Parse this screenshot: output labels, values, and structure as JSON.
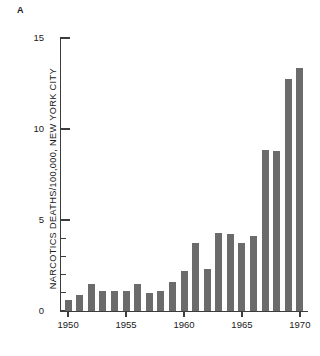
{
  "figure": {
    "panel_label": "A",
    "background_color": "#ffffff",
    "bar_color": "#6b6b6b",
    "axis_color": "#3c3c3c"
  },
  "chart_data": {
    "type": "bar",
    "title": "",
    "subtitle": "",
    "panel": "A",
    "xlabel": "",
    "ylabel": "NARCOTICS DEATHS/100,000, NEW YORK CITY",
    "categories": [
      "1950",
      "1951",
      "1952",
      "1953",
      "1954",
      "1955",
      "1956",
      "1957",
      "1958",
      "1959",
      "1960",
      "1961",
      "1962",
      "1963",
      "1964",
      "1965",
      "1966",
      "1967",
      "1968",
      "1969",
      "1970"
    ],
    "values": [
      0.6,
      0.9,
      1.5,
      1.1,
      1.1,
      1.1,
      1.5,
      1.0,
      1.1,
      1.6,
      2.2,
      3.75,
      2.3,
      4.3,
      4.25,
      3.75,
      4.1,
      8.85,
      8.8,
      12.75,
      13.35
    ],
    "xlim": [
      1949.3,
      1970.7
    ],
    "ylim": [
      0,
      15
    ],
    "ytick_major": [
      0,
      5,
      10,
      15
    ],
    "ytick_major_labels": [
      "0",
      "5",
      "10",
      "15"
    ],
    "ytick_minor": [
      1,
      2,
      3,
      4
    ],
    "xticks": [
      1950,
      1955,
      1960,
      1965,
      1970
    ],
    "xtick_labels": [
      "1950",
      "1955",
      "1960",
      "1965",
      "1970"
    ],
    "grid": false,
    "legend": null,
    "annotations": []
  }
}
